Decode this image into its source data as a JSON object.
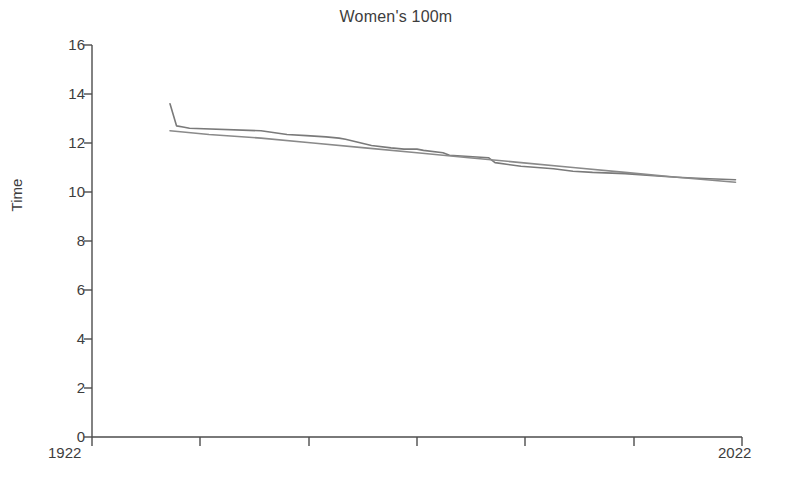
{
  "chart_data": {
    "type": "line",
    "title": "Women's 100m",
    "xlabel": "",
    "ylabel": "Time",
    "xlim": [
      1922,
      2022
    ],
    "ylim": [
      0,
      16
    ],
    "ytick_labels": [
      "16",
      "14",
      "12",
      "10",
      "8",
      "6",
      "4",
      "2",
      "0"
    ],
    "ytick_values": [
      16,
      14,
      12,
      10,
      8,
      6,
      4,
      2,
      0
    ],
    "xtick_labels": [
      "1922",
      "2022"
    ],
    "xtick_values": [
      1922,
      2022
    ],
    "grid": false,
    "legend": false,
    "series": [
      {
        "name": "record",
        "color": "#7a7a7a",
        "x": [
          1934,
          1935,
          1936,
          1937,
          1948,
          1952,
          1955,
          1958,
          1960,
          1961,
          1965,
          1968,
          1970,
          1972,
          1973,
          1976,
          1977,
          1983,
          1984,
          1988,
          1993,
          1996,
          1999,
          2004,
          2009,
          2012,
          2016,
          2021
        ],
        "y": [
          13.6,
          12.7,
          12.65,
          12.6,
          12.5,
          12.35,
          12.3,
          12.25,
          12.2,
          12.15,
          11.9,
          11.8,
          11.75,
          11.75,
          11.7,
          11.6,
          11.5,
          11.4,
          11.2,
          11.05,
          10.95,
          10.85,
          10.8,
          10.75,
          10.65,
          10.6,
          10.55,
          10.5
        ]
      },
      {
        "name": "trend",
        "color": "#8a8a8a",
        "x": [
          1934,
          1940,
          1948,
          1956,
          1964,
          1972,
          1980,
          1988,
          1996,
          2004,
          2012,
          2021
        ],
        "y": [
          12.5,
          12.35,
          12.2,
          12.0,
          11.8,
          11.6,
          11.4,
          11.2,
          11.0,
          10.8,
          10.6,
          10.4
        ]
      }
    ]
  },
  "axes": {
    "title": "Women's 100m",
    "y_label": "Time",
    "x_min_label": "1922",
    "x_max_label": "2022",
    "y_ticks": [
      {
        "label": "16"
      },
      {
        "label": "14"
      },
      {
        "label": "12"
      },
      {
        "label": "10"
      },
      {
        "label": "8"
      },
      {
        "label": "6"
      },
      {
        "label": "4"
      },
      {
        "label": "2"
      },
      {
        "label": "0"
      }
    ]
  },
  "style": {
    "axis_color": "#4d4d4d",
    "line_color_record": "#7a7a7a",
    "line_color_trend": "#8a8a8a",
    "background": "#ffffff"
  }
}
